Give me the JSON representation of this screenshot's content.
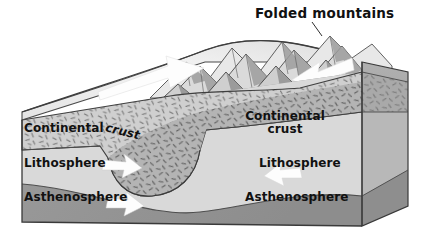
{
  "diagram": {
    "title": "Folded mountains",
    "labels": {
      "crust_left_word1": "Continental",
      "crust_left_word2": "crust",
      "lithosphere_left": "Lithosphere",
      "asthenosphere_left": "Asthenosphere",
      "crust_right_line1": "Continental",
      "crust_right_line2": "crust",
      "lithosphere_right": "Lithosphere",
      "asthenosphere_right": "Asthenosphere"
    },
    "icons": {
      "leader_line": "title-leader-line-icon",
      "arrow_top_left": "white-arrow-right-icon",
      "arrow_top_right": "white-arrow-left-icon",
      "arrow_litho_left": "white-arrow-right-icon",
      "arrow_asth_left": "white-arrow-right-icon",
      "arrow_litho_right": "white-arrow-left-icon",
      "mountains": "folded-mountain-range-icon",
      "slab_root": "crustal-root-icon"
    },
    "colors": {
      "background": "#ffffff",
      "outline": "#3a3a3a",
      "text": "#111111",
      "top_surface_light": "#f2f2f2",
      "top_surface_mid": "#dcdcdc",
      "crust_front": "#cfcfcf",
      "crust_root": "#b4b4b4",
      "lithosphere_front": "#d9d9d9",
      "asthenosphere_front": "#9a9a9a",
      "right_face_crust": "#a9a9a9",
      "right_face_litho": "#b8b8b8",
      "right_face_asth": "#8e8e8e",
      "arrow_white": "#fdfdfd",
      "mountain_shadow": "#8f8f8f"
    }
  }
}
